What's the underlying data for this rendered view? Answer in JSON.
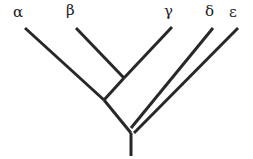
{
  "figure": {
    "kind": "cladogram",
    "title": "",
    "background_color": "#ffffff",
    "line_color": "#2a2826",
    "line_width": 3,
    "label_color": "#23211f",
    "label_font_size": 15
  },
  "taxa": [
    {
      "id": "alpha",
      "label": "α",
      "label_x": 13,
      "label_y": 5,
      "tip_x": 25,
      "tip_y": 28
    },
    {
      "id": "beta",
      "label": "β",
      "label_x": 66,
      "label_y": 3,
      "tip_x": 76,
      "tip_y": 28
    },
    {
      "id": "gamma",
      "label": "γ",
      "label_x": 164,
      "label_y": 4,
      "tip_x": 172,
      "tip_y": 27
    },
    {
      "id": "delta",
      "label": "δ",
      "label_x": 205,
      "label_y": 4,
      "tip_x": 213,
      "tip_y": 28
    },
    {
      "id": "epsilon",
      "label": "ε",
      "label_x": 229,
      "label_y": 5,
      "tip_x": 238,
      "tip_y": 28
    }
  ],
  "nodes": [
    {
      "id": "node-beta-gamma",
      "x": 124,
      "y": 78,
      "children": [
        "beta",
        "gamma"
      ]
    },
    {
      "id": "node-alpha-clade",
      "x": 104,
      "y": 100,
      "children": [
        "alpha",
        "node-beta-gamma"
      ]
    },
    {
      "id": "root",
      "x": 131,
      "y": 133,
      "children": [
        "node-alpha-clade",
        "delta",
        "epsilon"
      ]
    }
  ],
  "branches": [
    {
      "id": "branch-alpha",
      "from": "alpha",
      "x1": 25,
      "y1": 28,
      "x2": 104,
      "y2": 100
    },
    {
      "id": "branch-beta",
      "from": "beta",
      "x1": 76,
      "y1": 28,
      "x2": 124,
      "y2": 78
    },
    {
      "id": "branch-gamma",
      "from": "gamma",
      "x1": 172,
      "y1": 27,
      "x2": 124,
      "y2": 78
    },
    {
      "id": "branch-beta-gamma-stem",
      "from": "node-beta-gamma",
      "x1": 124,
      "y1": 78,
      "x2": 104,
      "y2": 100
    },
    {
      "id": "branch-alpha-clade-stem",
      "from": "node-alpha-clade",
      "x1": 104,
      "y1": 100,
      "x2": 131,
      "y2": 133
    },
    {
      "id": "branch-delta",
      "from": "delta",
      "x1": 213,
      "y1": 28,
      "x2": 131,
      "y2": 128
    },
    {
      "id": "branch-epsilon",
      "from": "epsilon",
      "x1": 238,
      "y1": 28,
      "x2": 134,
      "y2": 133
    },
    {
      "id": "branch-root-stem",
      "from": "root",
      "x1": 131,
      "y1": 133,
      "x2": 131,
      "y2": 156
    }
  ]
}
